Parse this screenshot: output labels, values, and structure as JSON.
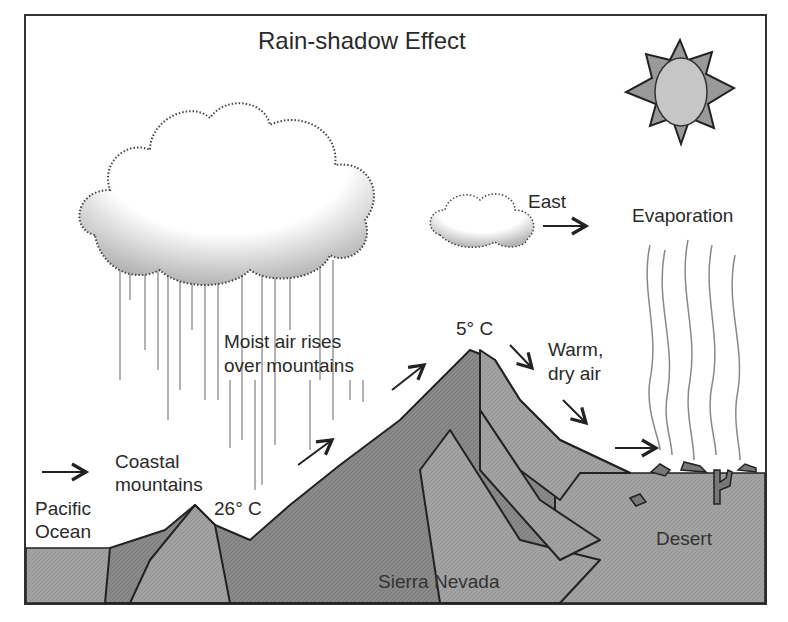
{
  "diagram": {
    "title": "Rain-shadow Effect",
    "labels": {
      "east": "East",
      "evaporation": "Evaporation",
      "moist_air_line1": "Moist air rises",
      "moist_air_line2": "over mountains",
      "peak_temp": "5° C",
      "warm_line1": "Warm,",
      "warm_line2": "dry air",
      "coastal_line1": "Coastal",
      "coastal_line2": "mountains",
      "pacific_line1": "Pacific",
      "pacific_line2": "Ocean",
      "coast_temp": "26° C",
      "desert": "Desert",
      "sierra": "Sierra Nevada"
    },
    "icons": [
      "sun-icon",
      "rain-cloud",
      "small-cloud",
      "wind-arrows",
      "evaporation-lines",
      "cactus-icon"
    ]
  }
}
